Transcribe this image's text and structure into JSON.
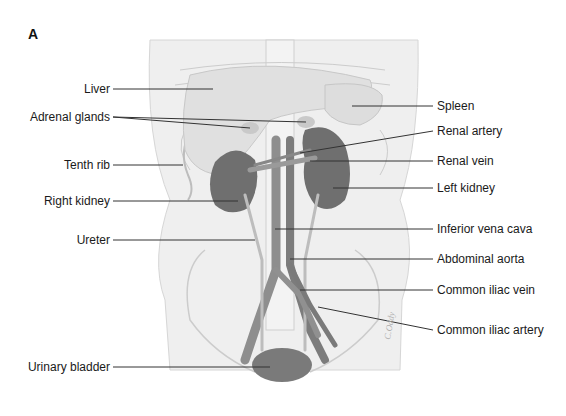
{
  "figure": {
    "panel_letter": "A",
    "signature": "C.Oddy",
    "colors": {
      "background": "#ffffff",
      "torso": "#efefef",
      "organ_light": "#e2e2e2",
      "kidney": "#6f6f6f",
      "vessel": "#8a8a8a",
      "leader_line": "#333333",
      "text": "#1a1a1a"
    },
    "labels_left": [
      {
        "text": "Liver"
      },
      {
        "text": "Adrenal glands"
      },
      {
        "text": "Tenth rib"
      },
      {
        "text": "Right kidney"
      },
      {
        "text": "Ureter"
      },
      {
        "text": "Urinary bladder"
      }
    ],
    "labels_right": [
      {
        "text": "Spleen"
      },
      {
        "text": "Renal artery"
      },
      {
        "text": "Renal vein"
      },
      {
        "text": "Left kidney"
      },
      {
        "text": "Inferior vena cava"
      },
      {
        "text": "Abdominal aorta"
      },
      {
        "text": "Common iliac vein"
      },
      {
        "text": "Common iliac artery"
      }
    ]
  }
}
